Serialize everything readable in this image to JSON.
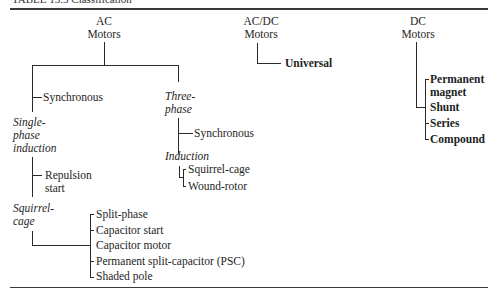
{
  "caption": "TABLE 13.3 Classification",
  "ac": {
    "title_line1": "AC",
    "title_line2": "Motors",
    "synchronous": "Synchronous",
    "single_phase": [
      "Single-",
      "phase",
      "induction"
    ],
    "repulsion": [
      "Repulsion",
      "start"
    ],
    "squirrel_cage": [
      "Squirrel-",
      "cage"
    ],
    "single_phase_types": [
      "Split-phase",
      "Capacitor start",
      "Capacitor motor",
      "Permanent split-capacitor (PSC)",
      "Shaded pole"
    ],
    "three_phase": [
      "Three-",
      "phase"
    ],
    "three_phase_synchronous": "Synchronous",
    "induction": "Induction",
    "induction_types": [
      "Squirrel-cage",
      "Wound-rotor"
    ]
  },
  "acdc": {
    "title_line1": "AC/DC",
    "title_line2": "Motors",
    "universal": "Universal"
  },
  "dc": {
    "title_line1": "DC",
    "title_line2": "Motors",
    "types": [
      "Permanent",
      "magnet",
      "Shunt",
      "Series",
      "Compound"
    ]
  }
}
